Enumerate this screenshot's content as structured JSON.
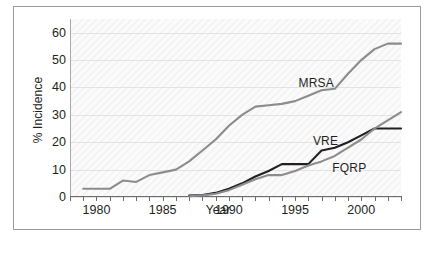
{
  "chart_data": {
    "type": "line",
    "title": "",
    "xlabel": "Year",
    "ylabel": "% Incidence",
    "xlim": [
      1978,
      2003
    ],
    "ylim": [
      0,
      65
    ],
    "yticks": [
      0,
      10,
      20,
      30,
      40,
      50,
      60
    ],
    "xticks": [
      1980,
      1985,
      1990,
      1995,
      2000
    ],
    "grid": true,
    "legend_position": "inline-annotations",
    "series": [
      {
        "name": "MRSA",
        "color": "#8c8c8c",
        "label_x": 1996.6,
        "label_y": 41.5,
        "x": [
          1979,
          1980,
          1981,
          1982,
          1983,
          1984,
          1985,
          1986,
          1987,
          1988,
          1989,
          1990,
          1991,
          1992,
          1993,
          1994,
          1995,
          1996,
          1997,
          1998,
          1999,
          2000,
          2001,
          2002,
          2003
        ],
        "y": [
          3,
          3,
          3,
          6,
          5.5,
          8,
          9,
          10,
          13,
          17,
          21,
          26,
          30,
          33,
          33.5,
          34,
          35,
          37,
          39,
          39.5,
          45,
          50,
          54,
          56,
          56
        ]
      },
      {
        "name": "VRE",
        "color": "#231f20",
        "label_x": 1997.3,
        "label_y": 20.5,
        "x": [
          1987,
          1988,
          1989,
          1990,
          1991,
          1992,
          1993,
          1994,
          1995,
          1996,
          1997,
          1998,
          1999,
          2000,
          2001,
          2002,
          2003
        ],
        "y": [
          0.5,
          0.7,
          1.5,
          3,
          5,
          7.5,
          9.5,
          12,
          12,
          12,
          17,
          18,
          20,
          22.5,
          25,
          25,
          25
        ]
      },
      {
        "name": "FQRP",
        "color": "#8c8c8c",
        "label_x": 1999.1,
        "label_y": 10.5,
        "x": [
          1987,
          1988,
          1989,
          1990,
          1991,
          1992,
          1993,
          1994,
          1995,
          1996,
          1997,
          1998,
          1999,
          2000,
          2001,
          2002,
          2003
        ],
        "y": [
          0.3,
          0.6,
          1.2,
          2.5,
          4.5,
          6.5,
          8,
          8,
          9.5,
          11.5,
          13,
          15,
          18,
          21,
          25,
          28,
          31
        ]
      }
    ]
  }
}
